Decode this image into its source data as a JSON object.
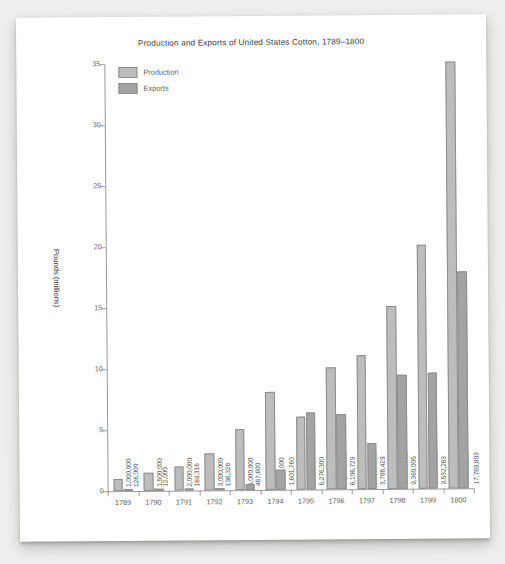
{
  "chart_data": {
    "type": "bar",
    "title": "Production and Exports of United States Cotton, 1789–1800",
    "xlabel": "",
    "ylabel": "Pounds (millions)",
    "ylim": [
      0,
      35
    ],
    "ytick_labels": [
      "0",
      "5",
      "10",
      "15",
      "20",
      "25",
      "30",
      "35"
    ],
    "ytick_values": [
      0,
      5,
      10,
      15,
      20,
      25,
      30,
      35
    ],
    "grid": false,
    "legend_position": "top-left",
    "categories": [
      "1789",
      "1790",
      "1791",
      "1792",
      "1793",
      "1794",
      "1795",
      "1796",
      "1797",
      "1798",
      "1799",
      "1800"
    ],
    "series": [
      {
        "name": "Production",
        "color": "#bdbdbd",
        "values": [
          1000000,
          1500000,
          2000000,
          3000000,
          5000000,
          8000000,
          6000000,
          10000000,
          11000000,
          15000000,
          20000000,
          35000000
        ],
        "labels": [
          "1,000,000",
          "1,500,000",
          "2,000,000",
          "3,000,000",
          "5,000,000",
          "8,000,000",
          "6,000,000",
          "10,000,000",
          "11,000,000",
          "15,000,000",
          "20,000,000",
          "35,000,000"
        ]
      },
      {
        "name": "Exports",
        "color": "#a3a3a3",
        "values": [
          126000,
          12000,
          189316,
          138328,
          487600,
          1601760,
          6276300,
          6106729,
          3788429,
          9360005,
          9532263,
          17789803
        ],
        "labels": [
          "126,000",
          "12,000",
          "189,316",
          "138,328",
          "487,600",
          "1,601,760",
          "6,276,300",
          "6,106,729",
          "3,788,429",
          "9,360,005",
          "9,532,263",
          "17,789,803"
        ]
      }
    ]
  }
}
